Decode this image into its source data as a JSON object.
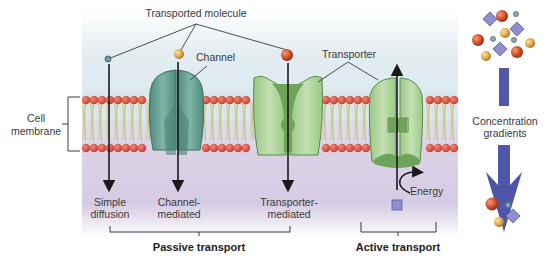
{
  "labels": {
    "transported_molecule": "Transported molecule",
    "channel": "Channel",
    "transporter": "Transporter",
    "cell_membrane_line1": "Cell",
    "cell_membrane_line2": "membrane",
    "simple_diffusion_line1": "Simple",
    "simple_diffusion_line2": "diffusion",
    "channel_mediated_line1": "Channel-",
    "channel_mediated_line2": "mediated",
    "transporter_mediated_line1": "Transporter-",
    "transporter_mediated_line2": "mediated",
    "energy": "Energy",
    "passive_transport": "Passive transport",
    "active_transport": "Active transport",
    "concentration_line1": "Concentration",
    "concentration_line2": "gradients"
  },
  "colors": {
    "extracellular": "#d9e8ee",
    "intracellular": "#d8cce6",
    "lipid_head": "#d9443a",
    "lipid_tail": "#d8cfa8",
    "channel_protein": "#5e9c8e",
    "transporter_protein": "#9cc68a",
    "gradient_arrow": "#4f56a8",
    "solute_square": "#8d8fcf"
  }
}
